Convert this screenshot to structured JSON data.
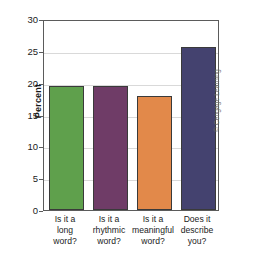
{
  "chart_data": {
    "type": "bar",
    "title": "",
    "xlabel": "",
    "ylabel": "Percent",
    "ylim": [
      0,
      30
    ],
    "ytick_step": 5,
    "yticks": [
      "0",
      "5",
      "10",
      "15",
      "20",
      "25",
      "30"
    ],
    "grid": "horizontal",
    "legend": "none",
    "categories": [
      "Is it a\nlong\nword?",
      "Is it a\nrhythmic\nword?",
      "Is it a\nmeaningful\nword?",
      "Does it\ndescribe\nyou?"
    ],
    "values": [
      19.5,
      19.5,
      17.9,
      25.6
    ],
    "bar_colors": [
      "#5fa04c",
      "#6f3c67",
      "#e2894a",
      "#44426f"
    ],
    "bar_outline_color": "#3a3a3a",
    "axis_color": "#5b5b5b",
    "gridline_color": "#d9d9d9"
  },
  "credit": {
    "text": "© Cengage Learning"
  }
}
